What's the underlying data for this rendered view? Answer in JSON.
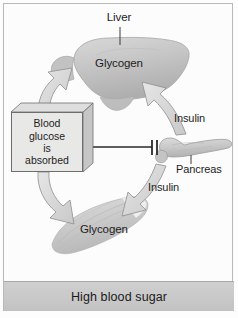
{
  "figure": {
    "border_color": "#b9b9b9",
    "background": "#fcfcfc"
  },
  "labels": {
    "liver": "Liver",
    "glycogen_liver": "Glycogen",
    "insulin_upper": "Insulin",
    "pancreas": "Pancreas",
    "insulin_lower": "Insulin",
    "glycogen_muscle": "Glycogen"
  },
  "blood_glucose_box": {
    "line1": "Blood",
    "line2": "glucose",
    "line3": "is",
    "line4": "absorbed",
    "fill": "#e8e8e6",
    "stroke": "#6e6e6e"
  },
  "footer": {
    "text": "High blood sugar",
    "band_color": "#c9c9c9"
  },
  "organs": {
    "liver_label": "liver",
    "pancreas_label": "pancreas",
    "muscle_label": "skeletal-muscle",
    "organ_fill": "#c8c8c8",
    "organ_stroke": "#9a9a9a"
  },
  "arrows": {
    "box_to_liver": "glucose uptake into liver",
    "box_to_muscle": "glucose uptake into muscle",
    "pancreas_to_liver": "Insulin",
    "pancreas_to_muscle": "Insulin",
    "inhibition": "blood glucose absorption inhibits pancreas signal",
    "fill": "#dcdcdc",
    "stroke": "#8e8e8e"
  }
}
